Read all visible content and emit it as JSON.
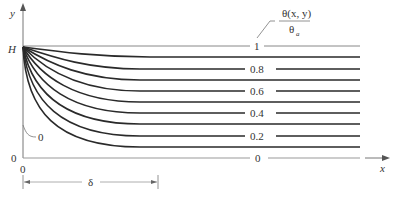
{
  "axes": {
    "y_label": "y",
    "x_label": "x",
    "y_top_label": "H",
    "y_origin_label": "0",
    "x_origin_label": "0"
  },
  "legend": {
    "numerator": "θ(x, y)",
    "denominator": "θ",
    "denominator_sub": "a"
  },
  "contours": {
    "top_label": "1",
    "labels": [
      "0.8",
      "0.6",
      "0.4",
      "0.2"
    ],
    "bottom_label": "0",
    "wall_label": "0"
  },
  "dimension": {
    "label": "δ"
  },
  "colors": {
    "line": "#2a2a2a",
    "thin_line": "#888888",
    "text": "#333333"
  }
}
